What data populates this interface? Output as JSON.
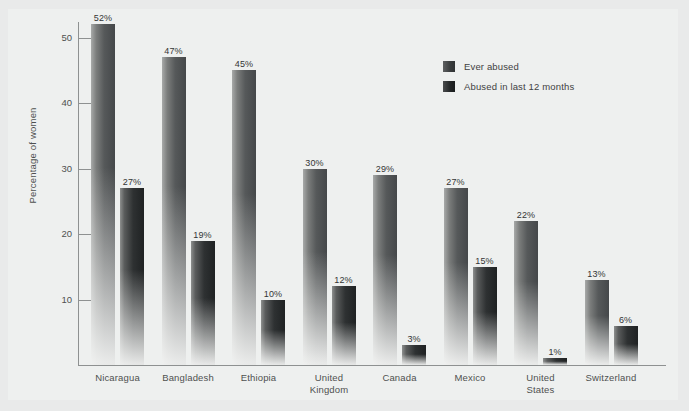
{
  "chart_data": {
    "type": "bar",
    "title": "",
    "subtitle": "",
    "xlabel": "",
    "ylabel": "Percentage of women",
    "ylim": [
      0,
      55
    ],
    "yticks": [
      10,
      20,
      30,
      40,
      50
    ],
    "ytick_labels": [
      "10",
      "20",
      "30",
      "40",
      "50"
    ],
    "grid": false,
    "legend_position": "top-right",
    "categories": [
      "Nicaragua",
      "Bangladesh",
      "Ethiopia",
      "United Kingdom",
      "Canada",
      "Mexico",
      "United States",
      "Switzerland"
    ],
    "series": [
      {
        "name": "Ever abused",
        "color": "#45484a",
        "values": [
          52,
          47,
          45,
          30,
          29,
          27,
          22,
          13
        ],
        "labels": [
          "52%",
          "47%",
          "45%",
          "30%",
          "29%",
          "27%",
          "22%",
          "13%"
        ]
      },
      {
        "name": "Abused in last 12 months",
        "color": "#1f2223",
        "values": [
          27,
          19,
          10,
          12,
          3,
          15,
          1,
          6
        ],
        "labels": [
          "27%",
          "19%",
          "10%",
          "12%",
          "3%",
          "15%",
          "1%",
          "6%"
        ]
      }
    ]
  },
  "axis": {
    "y_title": "Percentage of women",
    "tick_labels": [
      "50",
      "40",
      "30",
      "20",
      "10"
    ]
  },
  "legend": {
    "entries": [
      {
        "label": "Ever abused"
      },
      {
        "label": "Abused in last 12 months"
      }
    ]
  },
  "xlabels": [
    {
      "lines": [
        "Nicaragua"
      ]
    },
    {
      "lines": [
        "Bangladesh"
      ]
    },
    {
      "lines": [
        "Ethiopia"
      ]
    },
    {
      "lines": [
        "United",
        "Kingdom"
      ]
    },
    {
      "lines": [
        "Canada"
      ]
    },
    {
      "lines": [
        "Mexico"
      ]
    },
    {
      "lines": [
        "United",
        "States"
      ]
    },
    {
      "lines": [
        "Switzerland"
      ]
    }
  ],
  "colors": {
    "background": "#e9eaea",
    "panel": "#eef0ef",
    "axis": "#8e9191",
    "text": "#4e5050",
    "series_ever": "#45484a",
    "series_recent": "#1f2223"
  }
}
